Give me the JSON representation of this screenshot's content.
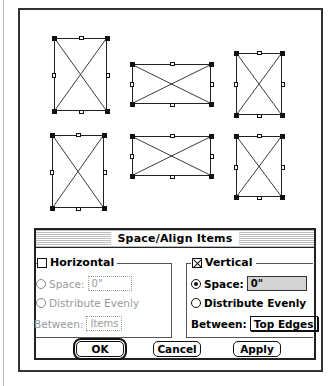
{
  "canvas": {
    "shapes": [
      {
        "id": 1,
        "x": 54,
        "y": 38,
        "w": 53,
        "h": 73
      },
      {
        "id": 2,
        "x": 132,
        "y": 64,
        "w": 79,
        "h": 40
      },
      {
        "id": 3,
        "x": 236,
        "y": 53,
        "w": 46,
        "h": 62
      },
      {
        "id": 4,
        "x": 52,
        "y": 135,
        "w": 52,
        "h": 73
      },
      {
        "id": 5,
        "x": 132,
        "y": 136,
        "w": 79,
        "h": 40
      },
      {
        "id": 6,
        "x": 236,
        "y": 136,
        "w": 46,
        "h": 61
      }
    ]
  },
  "dialog": {
    "title": "Space/Align Items",
    "horizontal": {
      "label": "Horizontal",
      "checked": false,
      "space_label": "Space:",
      "space_value": "0\"",
      "distribute_label": "Distribute Evenly",
      "between_label": "Between:",
      "between_value": "Items"
    },
    "vertical": {
      "label": "Vertical",
      "checked": true,
      "space_label": "Space:",
      "space_value": "0\"",
      "space_selected": true,
      "distribute_label": "Distribute Evenly",
      "between_label": "Between:",
      "between_value": "Top Edges"
    },
    "buttons": {
      "ok": "OK",
      "cancel": "Cancel",
      "apply": "Apply"
    }
  }
}
